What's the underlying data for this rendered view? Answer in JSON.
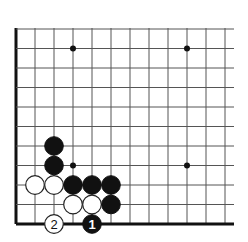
{
  "board": {
    "description": "Go problem diagram, lower-left corner",
    "left_edge_x": 16,
    "bottom_edge_y": 224,
    "top_y": 28,
    "right_x": 234,
    "spacing_x": 19,
    "spacing_y": 19.5,
    "columns": 12,
    "rows": 11,
    "colors": {
      "line": "#555555",
      "edge": "#111111",
      "black": "#111111",
      "white": "#ffffff"
    }
  },
  "star_points": [
    {
      "col": 4,
      "row": 4
    },
    {
      "col": 10,
      "row": 4
    },
    {
      "col": 4,
      "row": 10
    },
    {
      "col": 10,
      "row": 10
    }
  ],
  "stones": [
    {
      "color": "black",
      "col": 3,
      "row": 5,
      "label": ""
    },
    {
      "color": "black",
      "col": 3,
      "row": 4,
      "label": ""
    },
    {
      "color": "white",
      "col": 2,
      "row": 3,
      "label": ""
    },
    {
      "color": "white",
      "col": 3,
      "row": 3,
      "label": ""
    },
    {
      "color": "black",
      "col": 4,
      "row": 3,
      "label": ""
    },
    {
      "color": "black",
      "col": 5,
      "row": 3,
      "label": ""
    },
    {
      "color": "black",
      "col": 6,
      "row": 3,
      "label": ""
    },
    {
      "color": "white",
      "col": 4,
      "row": 2,
      "label": ""
    },
    {
      "color": "white",
      "col": 5,
      "row": 2,
      "label": ""
    },
    {
      "color": "black",
      "col": 6,
      "row": 2,
      "label": ""
    },
    {
      "color": "white",
      "col": 3,
      "row": 1,
      "label": "2"
    },
    {
      "color": "black",
      "col": 5,
      "row": 1,
      "label": "1"
    }
  ]
}
